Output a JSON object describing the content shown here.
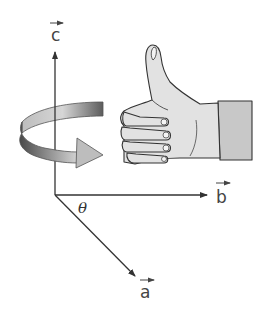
{
  "diagram": {
    "type": "right-hand-rule",
    "vectors": [
      {
        "id": "c",
        "label": "c",
        "direction": "up"
      },
      {
        "id": "b",
        "label": "b",
        "direction": "right"
      },
      {
        "id": "a",
        "label": "a",
        "direction": "down-right"
      }
    ],
    "angle_label": "θ",
    "rotation_arrow": "curved arrow circling the c axis from a toward b",
    "hand": "right hand, thumbs up, thumb aligned with c",
    "colors": {
      "line": "#333333",
      "hand_fill": "#e2e2e2",
      "cuff_fill": "#c8c8c8",
      "arrow_light": "#d0d0d0",
      "arrow_dark": "#5a5a5a"
    }
  }
}
